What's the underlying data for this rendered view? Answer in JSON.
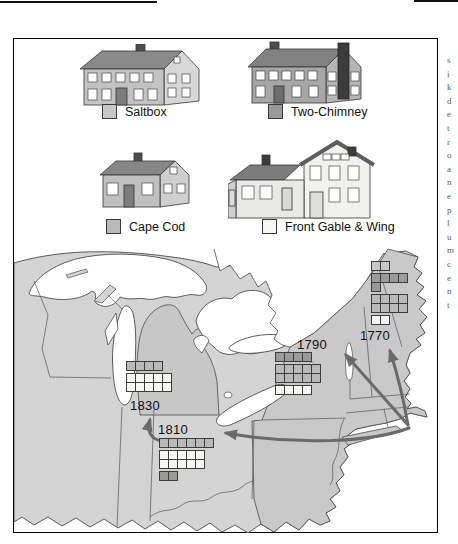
{
  "legend": {
    "items": [
      {
        "id": "saltbox",
        "label": "Saltbox",
        "swatch": "#c8c8c8"
      },
      {
        "id": "two_chimney",
        "label": "Two-Chimney",
        "swatch": "#9a9a9a"
      },
      {
        "id": "cape_cod",
        "label": "Cape Cod",
        "swatch": "#b9b9b9"
      },
      {
        "id": "front_gable",
        "label": "Front Gable & Wing",
        "swatch": "#f6f6f2"
      }
    ]
  },
  "map": {
    "sites": [
      {
        "year": "1770",
        "rows": [
          {
            "type": "saltbox",
            "cells": 2
          },
          {
            "type": "two_chimney",
            "cells": 4,
            "gap_before": true
          },
          {
            "type": "two_chimney",
            "cells": 1
          },
          {
            "type": "cape_cod",
            "cells": 4,
            "gap_before": true
          },
          {
            "type": "cape_cod",
            "cells": 4
          },
          {
            "type": "front_gable",
            "cells": 2,
            "gap_before": true
          }
        ]
      },
      {
        "year": "1790",
        "rows": [
          {
            "type": "two_chimney",
            "cells": 4
          },
          {
            "type": "cape_cod",
            "cells": 5,
            "gap_before": true
          },
          {
            "type": "cape_cod",
            "cells": 5
          },
          {
            "type": "front_gable",
            "cells": 4,
            "gap_before": true
          }
        ]
      },
      {
        "year": "1810",
        "rows": [
          {
            "type": "cape_cod",
            "cells": 6
          },
          {
            "type": "front_gable",
            "cells": 5,
            "gap_before": true
          },
          {
            "type": "front_gable",
            "cells": 5
          },
          {
            "type": "two_chimney",
            "cells": 2,
            "gap_before": true
          }
        ]
      },
      {
        "year": "1830",
        "rows": [
          {
            "type": "cape_cod",
            "cells": 4
          },
          {
            "type": "front_gable",
            "cells": 5,
            "gap_before": true
          },
          {
            "type": "front_gable",
            "cells": 5
          }
        ]
      }
    ]
  },
  "chart_data": {
    "type": "pictograph-map",
    "categories": [
      "1770",
      "1790",
      "1810",
      "1830"
    ],
    "series": [
      {
        "name": "Saltbox",
        "values": [
          2,
          0,
          0,
          0
        ]
      },
      {
        "name": "Two-Chimney",
        "values": [
          5,
          4,
          2,
          0
        ]
      },
      {
        "name": "Cape Cod",
        "values": [
          8,
          10,
          6,
          4
        ]
      },
      {
        "name": "Front Gable & Wing",
        "values": [
          2,
          4,
          10,
          10
        ]
      }
    ],
    "legend_position": "top",
    "unit": "house symbols per dated location"
  },
  "margin_text_fragments": [
    "s",
    "i",
    "k",
    "d",
    "e",
    "t",
    "r",
    "o",
    "a",
    "n",
    "e",
    "p",
    "l",
    "u",
    "m",
    "c",
    "e",
    "n",
    "t"
  ]
}
